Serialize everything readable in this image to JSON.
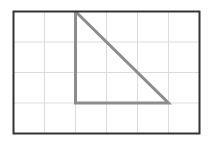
{
  "figure": {
    "name": "right-triangle-on-grid",
    "canvas": {
      "width": 213,
      "height": 142
    },
    "background_color": "#ffffff"
  },
  "frame": {
    "name": "grid-border-rectangle",
    "x": 13.5,
    "y": 11.5,
    "width": 186,
    "height": 122,
    "stroke_color": "#333333",
    "stroke_width": 2,
    "fill": "none"
  },
  "grid": {
    "columns": 6,
    "rows": 4,
    "cell_width": 31,
    "cell_height": 30.5,
    "stroke_color": "#dcdcdc",
    "stroke_width": 1,
    "vertical_lines_x": [
      44.5,
      75.5,
      106.5,
      137.5,
      168.5
    ],
    "horizontal_lines_y": [
      42,
      72.5,
      103
    ]
  },
  "triangle": {
    "name": "right-triangle",
    "stroke_color": "#8c8c8c",
    "stroke_width": 3,
    "fill": "none",
    "points": "75.5,11.5 75.5,103 168.5,103",
    "vertices": [
      {
        "label": "apex",
        "x": 75.5,
        "y": 11.5,
        "grid_col": 2,
        "grid_row": 0
      },
      {
        "label": "right-angle",
        "x": 75.5,
        "y": 103,
        "grid_col": 2,
        "grid_row": 3
      },
      {
        "label": "base-end",
        "x": 168.5,
        "y": 103,
        "grid_col": 5,
        "grid_row": 3
      }
    ],
    "legs": {
      "vertical_cells": 3,
      "horizontal_cells": 3
    }
  }
}
